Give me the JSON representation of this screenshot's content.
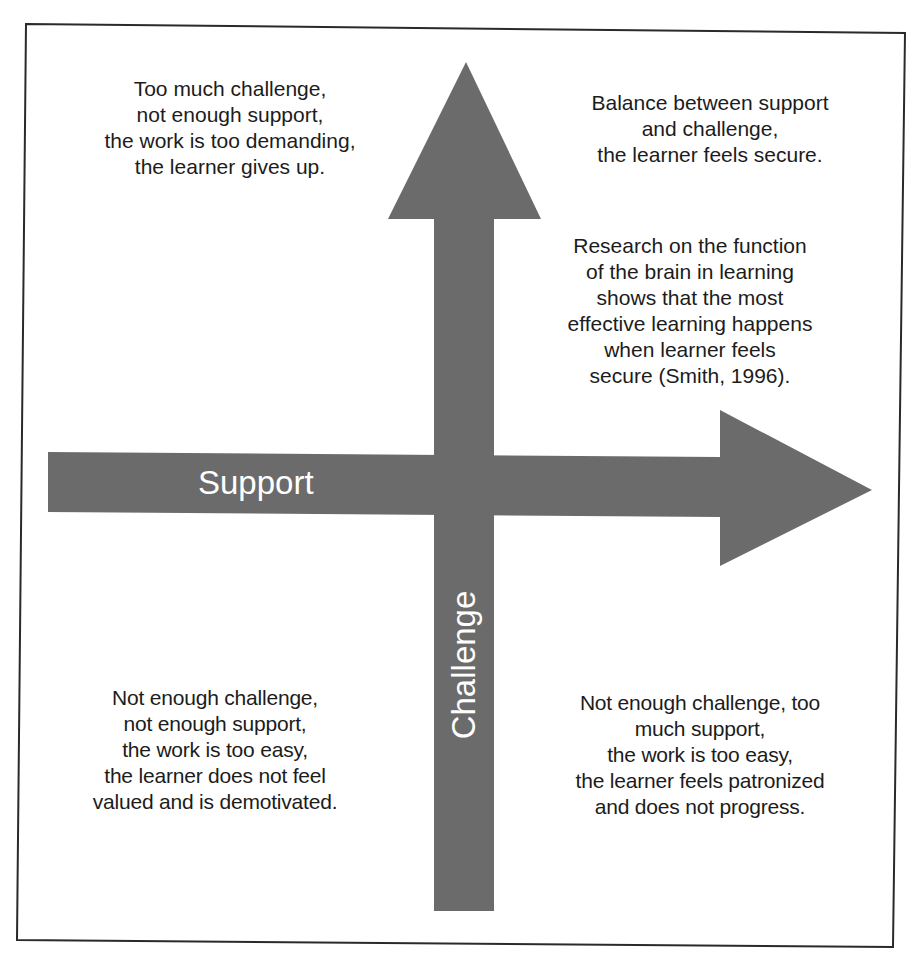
{
  "diagram": {
    "colors": {
      "arrow_fill": "#6b6b6b",
      "frame_stroke": "#2a2a2a",
      "text": "#1c1c1c",
      "arrow_label": "#ffffff",
      "background": "#ffffff"
    },
    "axes": {
      "horizontal": {
        "label": "Support",
        "direction": "right"
      },
      "vertical": {
        "label": "Challenge",
        "direction": "up"
      }
    },
    "quadrants": {
      "top_left": {
        "text": "Too much challenge,\nnot enough support,\nthe work is too demanding,\nthe learner gives up."
      },
      "top_right": {
        "text": "Balance between support\nand challenge,\nthe learner feels secure.",
        "note": "Research on the function\nof the brain in learning\nshows that the most\neffective learning happens\nwhen learner feels\nsecure (Smith, 1996)."
      },
      "bottom_left": {
        "text": "Not enough challenge,\nnot enough support,\nthe work is too easy,\nthe learner does not feel\nvalued and is demotivated."
      },
      "bottom_right": {
        "text": "Not enough challenge, too\nmuch support,\nthe work is too easy,\nthe learner feels patronized\nand does not progress."
      }
    }
  }
}
